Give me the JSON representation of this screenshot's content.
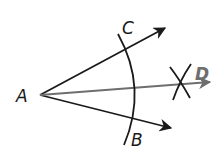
{
  "diagram": {
    "colors": {
      "primary": "#1a1a1a",
      "bisector": "#6e6e6e",
      "background": "#ffffff"
    },
    "points": {
      "A": {
        "label": "A",
        "x": 40,
        "y": 95
      },
      "B": {
        "label": "B",
        "x": 140,
        "y": 138
      },
      "C": {
        "label": "C",
        "x": 128,
        "y": 30
      },
      "D": {
        "label": "D",
        "x": 203,
        "y": 76
      }
    },
    "rays": [
      {
        "name": "AC",
        "from": "A",
        "to": [
          167,
          27
        ]
      },
      {
        "name": "AB",
        "from": "A",
        "to": [
          173,
          128
        ]
      },
      {
        "name": "AD",
        "from": "A",
        "to": [
          212,
          82
        ],
        "style": "bisector"
      }
    ],
    "arcs": [
      {
        "name": "main-arc",
        "center": "A",
        "description": "arc centered at A crossing rays AC and AB"
      },
      {
        "name": "intersection-arcs",
        "description": "two small arcs crossing at X mark on ray AD"
      }
    ]
  }
}
